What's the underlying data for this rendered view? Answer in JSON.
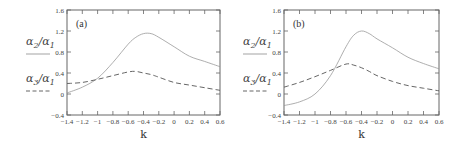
{
  "chart_data": [
    {
      "type": "line",
      "panel": "(a)",
      "xlabel": "k",
      "ylabel": "",
      "xlim": [
        -1.4,
        0.6
      ],
      "ylim": [
        -0.4,
        1.6
      ],
      "xticks": [
        "-1.4",
        "-1.2",
        "-1",
        "-0.8",
        "-0.6",
        "-0.4",
        "-0.2",
        "0",
        "0.2",
        "0.4",
        "0.6"
      ],
      "yticks": [
        "-0.4",
        "0",
        "0.4",
        "0.8",
        "1.2",
        "1.6"
      ],
      "legend": [
        "α2/α1",
        "α3/α1"
      ],
      "x": [
        -1.4,
        -1.2,
        -1.0,
        -0.8,
        -0.6,
        -0.5,
        -0.4,
        -0.3,
        -0.2,
        0.0,
        0.2,
        0.4,
        0.6
      ],
      "series": [
        {
          "name": "α2/α1",
          "style": "solid",
          "values": [
            0.02,
            0.13,
            0.3,
            0.6,
            0.95,
            1.08,
            1.15,
            1.15,
            1.08,
            0.9,
            0.72,
            0.62,
            0.52
          ]
        },
        {
          "name": "α3/α1",
          "style": "dashed",
          "values": [
            0.2,
            0.22,
            0.28,
            0.35,
            0.42,
            0.43,
            0.4,
            0.37,
            0.32,
            0.22,
            0.17,
            0.12,
            0.07
          ]
        }
      ]
    },
    {
      "type": "line",
      "panel": "(b)",
      "xlabel": "k",
      "ylabel": "",
      "xlim": [
        -1.4,
        0.6
      ],
      "ylim": [
        -0.4,
        1.6
      ],
      "xticks": [
        "-1.4",
        "-1.2",
        "-1",
        "-0.8",
        "-0.6",
        "-0.4",
        "-0.2",
        "0",
        "0.2",
        "0.4",
        "0.6"
      ],
      "yticks": [
        "-0.4",
        "0",
        "0.4",
        "0.8",
        "1.2",
        "1.6"
      ],
      "legend": [
        "α2/α1",
        "α3/α1"
      ],
      "x": [
        -1.4,
        -1.2,
        -1.0,
        -0.8,
        -0.6,
        -0.5,
        -0.4,
        -0.3,
        -0.2,
        0.0,
        0.2,
        0.4,
        0.6
      ],
      "series": [
        {
          "name": "α2/α1",
          "style": "solid",
          "values": [
            -0.22,
            -0.15,
            0.0,
            0.35,
            0.9,
            1.12,
            1.2,
            1.15,
            1.05,
            0.88,
            0.7,
            0.58,
            0.48
          ]
        },
        {
          "name": "α3/α1",
          "style": "dashed",
          "values": [
            0.13,
            0.22,
            0.33,
            0.45,
            0.57,
            0.55,
            0.5,
            0.43,
            0.35,
            0.24,
            0.16,
            0.11,
            0.06
          ]
        }
      ]
    }
  ]
}
